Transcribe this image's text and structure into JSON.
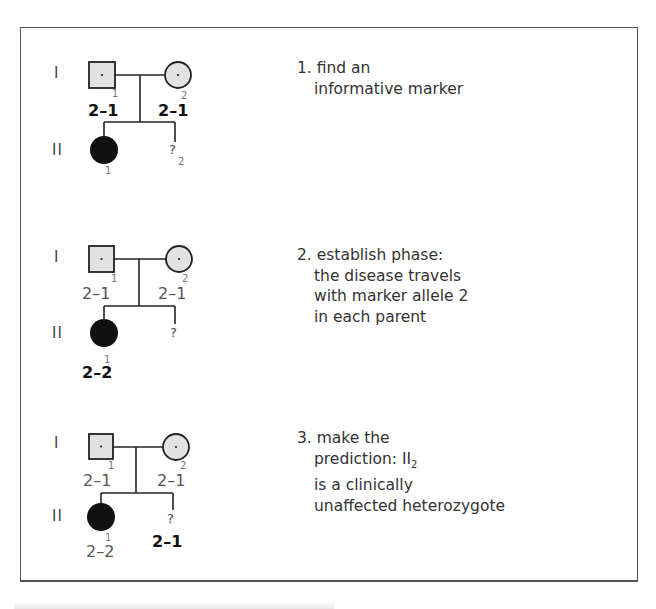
{
  "colors": {
    "frame": "#555555",
    "line": "#222222",
    "carrier_fill": "#e2e2e2",
    "affected_fill": "#111111"
  },
  "generation_labels": {
    "gen1": "I",
    "gen2": "II"
  },
  "panels": [
    {
      "id": 1,
      "step_lines": [
        "1. find an",
        "informative marker"
      ],
      "father": {
        "symbol": "square",
        "status": "carrier",
        "index": "1",
        "genotype": "2–1",
        "genotype_bold": true
      },
      "mother": {
        "symbol": "circle",
        "status": "carrier",
        "index": "2",
        "genotype": "2–1",
        "genotype_bold": true
      },
      "daughter": {
        "symbol": "circle",
        "status": "affected",
        "index": "1",
        "genotype": ""
      },
      "unknown_child": {
        "symbol": "?",
        "index": "2",
        "genotype": ""
      }
    },
    {
      "id": 2,
      "step_lines": [
        "2. establish phase:",
        "the disease travels",
        "with marker allele 2",
        "in each parent"
      ],
      "father": {
        "symbol": "square",
        "status": "carrier",
        "index": "1",
        "genotype": "2–1",
        "genotype_bold": false
      },
      "mother": {
        "symbol": "circle",
        "status": "carrier",
        "index": "2",
        "genotype": "2–1",
        "genotype_bold": false
      },
      "daughter": {
        "symbol": "circle",
        "status": "affected",
        "index": "1",
        "genotype": "2–2",
        "genotype_bold": true
      },
      "unknown_child": {
        "symbol": "?",
        "index": "",
        "genotype": ""
      }
    },
    {
      "id": 3,
      "step_lines": [
        "3. make the",
        "prediction: II",
        "is a clinically",
        "unaffected heterozygote"
      ],
      "step_subscript": "2",
      "father": {
        "symbol": "square",
        "status": "carrier",
        "index": "1",
        "genotype": "2–1",
        "genotype_bold": false
      },
      "mother": {
        "symbol": "circle",
        "status": "carrier",
        "index": "2",
        "genotype": "2–1",
        "genotype_bold": false
      },
      "daughter": {
        "symbol": "circle",
        "status": "affected",
        "index": "1",
        "genotype": "2–2",
        "genotype_bold": false
      },
      "unknown_child": {
        "symbol": "?",
        "index": "",
        "genotype": "2–1",
        "genotype_bold": true
      }
    }
  ]
}
